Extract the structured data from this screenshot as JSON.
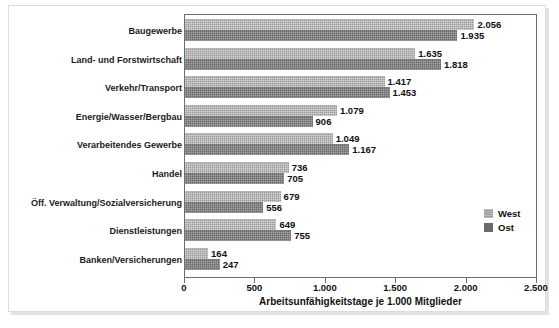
{
  "chart_data": {
    "type": "bar",
    "orientation": "horizontal",
    "title": "",
    "xlabel": "Arbeitsunfähigkeitstage je 1.000 Mitglieder",
    "ylabel": "",
    "xlim": [
      0,
      2500
    ],
    "grid": false,
    "legend_position": "right-middle",
    "categories": [
      "Baugewerbe",
      "Land- und Forstwirtschaft",
      "Verkehr/Transport",
      "Energie/Wasser/Bergbau",
      "Verarbeitendes Gewerbe",
      "Handel",
      "Öff. Verwaltung/Sozialversicherung",
      "Dienstleistungen",
      "Banken/Versicherungen"
    ],
    "series": [
      {
        "name": "West",
        "color": "#9d9d9d",
        "values": [
          2056,
          1635,
          1417,
          1079,
          1049,
          736,
          679,
          649,
          164
        ],
        "labels": [
          "2.056",
          "1.635",
          "1.417",
          "1.079",
          "1.049",
          "736",
          "679",
          "649",
          "164"
        ]
      },
      {
        "name": "Ost",
        "color": "#6a6a6a",
        "values": [
          1935,
          1818,
          1453,
          906,
          1167,
          705,
          556,
          755,
          247
        ],
        "labels": [
          "1.935",
          "1.818",
          "1.453",
          "906",
          "1.167",
          "705",
          "556",
          "755",
          "247"
        ]
      }
    ],
    "xticks": [
      0,
      500,
      1000,
      1500,
      2000,
      2500
    ],
    "xticklabels": [
      "0",
      "500",
      "1.000",
      "1.500",
      "2.000",
      "2.500"
    ]
  }
}
